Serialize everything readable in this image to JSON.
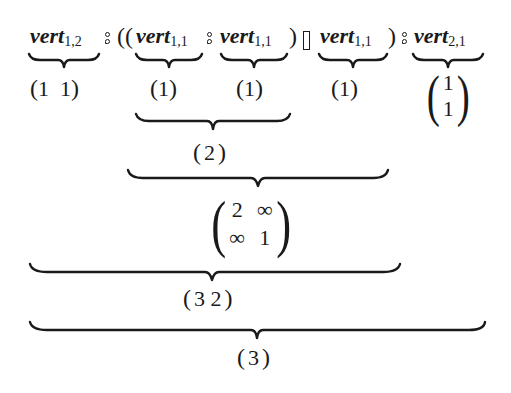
{
  "expression": {
    "terms": [
      {
        "name": "vert",
        "sub": "1,2"
      },
      {
        "name": "vert",
        "sub": "1,1"
      },
      {
        "name": "vert",
        "sub": "1,1"
      },
      {
        "name": "vert",
        "sub": "1,1"
      },
      {
        "name": "vert",
        "sub": "2,1"
      }
    ],
    "operators": {
      "seq": "⨾",
      "choice": "▯",
      "open_double": "((",
      "close": ")"
    }
  },
  "level1": {
    "term0": {
      "open": "(",
      "values": "1  1",
      "close": ")"
    },
    "term1": {
      "open": "(",
      "values": "1",
      "close": ")"
    },
    "term2": {
      "open": "(",
      "values": "1",
      "close": ")"
    },
    "term3": {
      "open": "(",
      "values": "1",
      "close": ")"
    },
    "term4": {
      "open": "(",
      "rows": [
        "1",
        "1"
      ],
      "close": ")"
    }
  },
  "level2": {
    "open": "(",
    "values": "2",
    "close": ")"
  },
  "level3": {
    "open": "(",
    "rows": [
      [
        "2",
        "∞"
      ],
      [
        "∞",
        "1"
      ]
    ],
    "close": ")"
  },
  "level4": {
    "open": "(",
    "values": "3 2",
    "close": ")"
  },
  "level5": {
    "open": "(",
    "values": "3",
    "close": ")"
  }
}
